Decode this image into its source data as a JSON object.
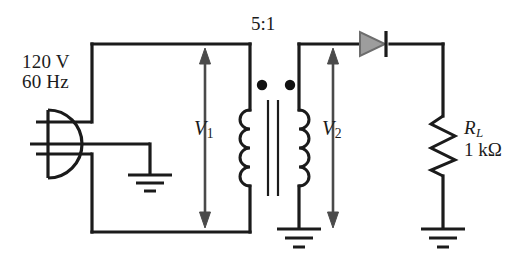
{
  "figure": {
    "type": "schematic-diagram",
    "background_color": "#ffffff",
    "wire_color": "#1b1b1b",
    "diode_fill_color": "#9a9a9a"
  },
  "labels": {
    "source_voltage": "120 V",
    "source_frequency": "60 Hz",
    "turns_ratio": "5:1",
    "primary_voltage": "V",
    "primary_voltage_sub": "1",
    "secondary_voltage": "V",
    "secondary_voltage_sub": "2",
    "load_name": "R",
    "load_name_sub": "L",
    "load_value": "1 kΩ"
  },
  "components": [
    {
      "name": "ac-plug-source",
      "label": "120 V 60 Hz",
      "symbol": "three-prong-plug"
    },
    {
      "name": "transformer",
      "label": "5:1",
      "symbol": "iron-core-transformer",
      "primary_winding_bumps": 4,
      "secondary_winding_bumps": 4,
      "polarity_dots": 2
    },
    {
      "name": "diode",
      "symbol": "rectifier-diode",
      "orientation": "anode-left-cathode-right"
    },
    {
      "name": "load-resistor",
      "label": "R_L 1 kΩ",
      "symbol": "zigzag-resistor"
    },
    {
      "name": "ground-source",
      "symbol": "earth-ground"
    },
    {
      "name": "ground-secondary",
      "symbol": "earth-ground"
    },
    {
      "name": "ground-load",
      "symbol": "earth-ground"
    }
  ],
  "measurements": [
    {
      "name": "primary-voltage-arrow",
      "label": "V1",
      "direction": "double-headed-vertical"
    },
    {
      "name": "secondary-voltage-arrow",
      "label": "V2",
      "direction": "double-headed-vertical"
    }
  ]
}
